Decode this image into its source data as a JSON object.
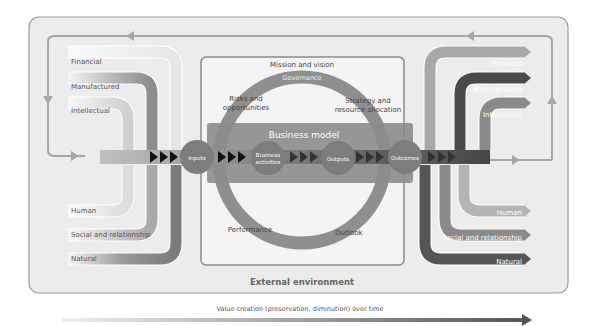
{
  "diagram": {
    "external_environment": "External environment",
    "value_creation": "Value creation (preservation, diminution) over time",
    "center": {
      "mission": "Mission and vision",
      "governance": "Governance",
      "risks_line1": "Risks and",
      "risks_line2": "opportunities",
      "strategy_line1": "Strategy and",
      "strategy_line2": "resource allocation",
      "business_model": "Business model",
      "performance": "Performance",
      "outlook": "Outlook"
    },
    "process": {
      "inputs": "Inputs",
      "activities_line1": "Business",
      "activities_line2": "activities",
      "outputs": "Outputs",
      "outcomes": "Outcomes"
    },
    "input_capitals": [
      "Financial",
      "Manufactured",
      "Intellectual",
      "Human",
      "Social and relationship",
      "Natural"
    ],
    "output_capitals": [
      "Financial",
      "Manufactured",
      "Intellectual",
      "Human",
      "Social and relationship",
      "Natural"
    ],
    "colors": {
      "frame_bg": "#ececec",
      "frame_border": "#9a9a9a",
      "loop_line": "#a6a6a6",
      "band": "#8f8f8f",
      "ring": "#8a8a8a",
      "node": "#7a7a7a"
    }
  }
}
